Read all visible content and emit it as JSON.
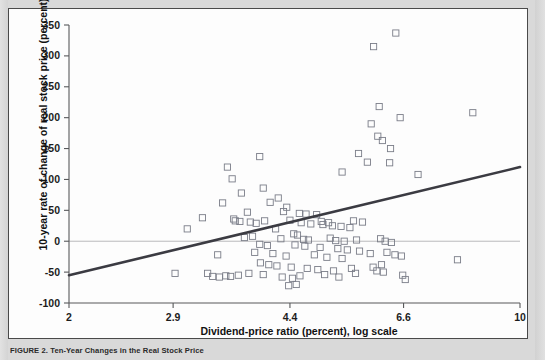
{
  "figure": {
    "caption_label": "FIGURE 2.",
    "caption_body": "Ten-Year Changes in the Real Stock Price"
  },
  "chart_data": {
    "type": "scatter",
    "title": "",
    "xlabel": "Dividend-price ratio (percent), log scale",
    "ylabel": "10-year rate of change of real stock price (percent)",
    "xscale": "log",
    "xlim": [
      2,
      10
    ],
    "ylim": [
      -100,
      350
    ],
    "xticks": [
      2,
      2.9,
      4.4,
      6.6,
      10
    ],
    "xtick_labels": [
      "2",
      "2.9",
      "4.4",
      "6.6",
      "10"
    ],
    "yticks": [
      -100,
      -50,
      0,
      50,
      100,
      150,
      200,
      250,
      300,
      350
    ],
    "ytick_labels": [
      "-100",
      "-50",
      "0",
      "50",
      "100",
      "150",
      "200",
      "250",
      "300",
      "350"
    ],
    "grid": false,
    "zero_reference_line": 0,
    "legend": null,
    "marker_style": "open-square",
    "marker_color": "#7a7d88",
    "trendline": {
      "type": "linear-fit",
      "color": "#3b3b42",
      "x_start": 2.0,
      "y_start": -55,
      "x_end": 10.0,
      "y_end": 120
    },
    "points": [
      [
        3.52,
        120
      ],
      [
        3.95,
        137
      ],
      [
        5.93,
        315
      ],
      [
        6.42,
        337
      ],
      [
        6.05,
        218
      ],
      [
        6.52,
        200
      ],
      [
        8.45,
        208
      ],
      [
        5.88,
        190
      ],
      [
        6.02,
        170
      ],
      [
        6.12,
        163
      ],
      [
        6.3,
        150
      ],
      [
        5.62,
        142
      ],
      [
        5.8,
        128
      ],
      [
        6.28,
        127
      ],
      [
        5.3,
        112
      ],
      [
        6.95,
        108
      ],
      [
        3.58,
        101
      ],
      [
        4.0,
        86
      ],
      [
        3.7,
        78
      ],
      [
        4.22,
        70
      ],
      [
        4.1,
        63
      ],
      [
        3.46,
        62
      ],
      [
        4.35,
        55
      ],
      [
        4.3,
        48
      ],
      [
        3.78,
        47
      ],
      [
        4.55,
        45
      ],
      [
        4.66,
        44
      ],
      [
        4.84,
        43
      ],
      [
        3.22,
        38
      ],
      [
        3.6,
        36
      ],
      [
        3.62,
        33
      ],
      [
        3.68,
        32
      ],
      [
        3.82,
        31
      ],
      [
        3.9,
        29
      ],
      [
        4.02,
        33
      ],
      [
        4.4,
        34
      ],
      [
        4.58,
        30
      ],
      [
        4.74,
        28
      ],
      [
        4.95,
        27
      ],
      [
        5.12,
        25
      ],
      [
        5.28,
        24
      ],
      [
        5.45,
        22
      ],
      [
        4.18,
        20
      ],
      [
        3.05,
        20
      ],
      [
        4.92,
        32
      ],
      [
        5.05,
        30
      ],
      [
        5.52,
        33
      ],
      [
        5.7,
        31
      ],
      [
        4.46,
        12
      ],
      [
        4.52,
        10
      ],
      [
        3.85,
        8
      ],
      [
        3.74,
        6
      ],
      [
        4.26,
        4
      ],
      [
        4.62,
        3
      ],
      [
        4.7,
        2
      ],
      [
        5.08,
        5
      ],
      [
        5.18,
        1
      ],
      [
        5.34,
        0
      ],
      [
        5.58,
        2
      ],
      [
        6.08,
        4
      ],
      [
        6.18,
        0
      ],
      [
        6.32,
        -2
      ],
      [
        3.95,
        -5
      ],
      [
        4.06,
        -7
      ],
      [
        4.48,
        -6
      ],
      [
        4.64,
        -8
      ],
      [
        4.9,
        -10
      ],
      [
        5.22,
        -12
      ],
      [
        5.4,
        -14
      ],
      [
        5.64,
        -16
      ],
      [
        3.4,
        -22
      ],
      [
        3.88,
        -18
      ],
      [
        4.14,
        -20
      ],
      [
        4.34,
        -24
      ],
      [
        4.8,
        -22
      ],
      [
        5.02,
        -26
      ],
      [
        5.3,
        -28
      ],
      [
        5.86,
        -20
      ],
      [
        6.22,
        -18
      ],
      [
        6.4,
        -22
      ],
      [
        6.55,
        -24
      ],
      [
        3.96,
        -35
      ],
      [
        4.08,
        -38
      ],
      [
        4.2,
        -40
      ],
      [
        4.42,
        -42
      ],
      [
        4.68,
        -44
      ],
      [
        4.86,
        -46
      ],
      [
        5.14,
        -48
      ],
      [
        5.48,
        -44
      ],
      [
        5.92,
        -42
      ],
      [
        6.1,
        -38
      ],
      [
        2.92,
        -52
      ],
      [
        3.28,
        -52
      ],
      [
        3.34,
        -57
      ],
      [
        3.42,
        -58
      ],
      [
        3.5,
        -56
      ],
      [
        3.56,
        -57
      ],
      [
        3.66,
        -55
      ],
      [
        3.8,
        -52
      ],
      [
        4.0,
        -54
      ],
      [
        4.28,
        -58
      ],
      [
        4.44,
        -60
      ],
      [
        4.56,
        -56
      ],
      [
        4.98,
        -54
      ],
      [
        5.24,
        -58
      ],
      [
        5.56,
        -52
      ],
      [
        6.0,
        -48
      ],
      [
        6.14,
        -50
      ],
      [
        6.58,
        -55
      ],
      [
        6.64,
        -62
      ],
      [
        8.0,
        -30
      ],
      [
        4.38,
        -72
      ],
      [
        4.5,
        -70
      ]
    ]
  }
}
